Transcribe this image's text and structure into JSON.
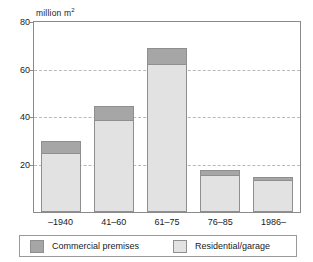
{
  "chart_data": {
    "type": "bar",
    "subtype": "stacked-bar",
    "title": "",
    "subtitle": "",
    "xlabel": "",
    "ylabel": "million m2",
    "ylabel_display": "million m",
    "ylabel_superscript": "2",
    "categories": [
      "–1940",
      "41–60",
      "61–75",
      "76–85",
      "1986–"
    ],
    "series": [
      {
        "name": "Residential/garage",
        "color": "#e2e2e2",
        "values": [
          24.8,
          38.8,
          62.5,
          15.6,
          13.6
        ]
      },
      {
        "name": "Commercial premises",
        "color": "#a6a6a6",
        "values": [
          5.0,
          6.0,
          6.5,
          1.9,
          1.0
        ]
      }
    ],
    "totals": [
      29.8,
      44.8,
      69.0,
      17.5,
      14.6
    ],
    "ylim": [
      0,
      80
    ],
    "yticks": [
      20,
      40,
      60,
      80
    ],
    "ytick_labels": [
      "20",
      "40",
      "60",
      "80"
    ],
    "grid": true,
    "gridlines_at": [
      20,
      40,
      60
    ],
    "legend_position": "bottom",
    "legend_entries": [
      {
        "label": "Commercial premises",
        "color": "#a6a6a6"
      },
      {
        "label": "Residential/garage",
        "color": "#e2e2e2"
      }
    ]
  },
  "colors": {
    "commercial": "#a6a6a6",
    "residential": "#e2e2e2",
    "axis": "#8a8a8a",
    "grid": "#b9b9b9",
    "text": "#1a1a1a",
    "background": "#ffffff"
  }
}
